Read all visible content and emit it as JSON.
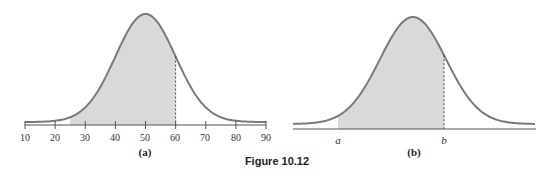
{
  "caption": "Figure 10.12",
  "colors": {
    "curve": "#7a7a7a",
    "fill": "#d9d9d9",
    "axis": "#555555"
  },
  "chart_data": [
    {
      "type": "area",
      "title": "(a)",
      "description": "Normal distribution curve with shaded area from about 25 to 60",
      "mean": 50,
      "std_dev": 10,
      "xlim": [
        10,
        90
      ],
      "x_ticks": [
        10,
        20,
        30,
        40,
        50,
        60,
        70,
        80,
        90
      ],
      "shaded_range": [
        25,
        60
      ],
      "dashed_line_at": 60,
      "xlabel": "",
      "ylabel": "",
      "grid": false
    },
    {
      "type": "area",
      "title": "(b)",
      "description": "Normal distribution curve with shaded area between a and b",
      "x_tick_labels": [
        "a",
        "b"
      ],
      "shaded_range": [
        "a",
        "b"
      ],
      "dashed_line_at": "b",
      "xlabel": "",
      "ylabel": "",
      "grid": false
    }
  ],
  "panel_a": {
    "label": "(a)",
    "ticks": [
      "10",
      "20",
      "30",
      "40",
      "50",
      "60",
      "70",
      "80",
      "90"
    ]
  },
  "panel_b": {
    "label": "(b)",
    "tick_a": "a",
    "tick_b": "b"
  }
}
